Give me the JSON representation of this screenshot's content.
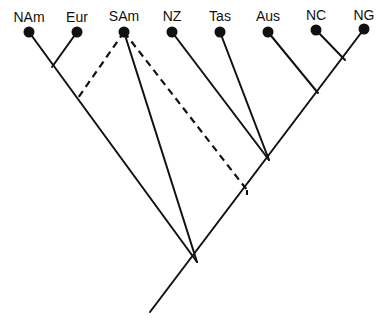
{
  "diagram": {
    "type": "cladogram",
    "colors": {
      "line": "#111111",
      "background": "#ffffff"
    },
    "taxa": [
      {
        "id": "NAm",
        "label": "NAm",
        "x": 29,
        "y": 32,
        "lx": 29,
        "ly": 10
      },
      {
        "id": "Eur",
        "label": "Eur",
        "x": 77,
        "y": 32,
        "lx": 77,
        "ly": 10
      },
      {
        "id": "SAm",
        "label": "SAm",
        "x": 124,
        "y": 32,
        "lx": 124,
        "ly": 9
      },
      {
        "id": "NZ",
        "label": "NZ",
        "x": 172,
        "y": 32,
        "lx": 172,
        "ly": 9
      },
      {
        "id": "Tas",
        "label": "Tas",
        "x": 220,
        "y": 32,
        "lx": 220,
        "ly": 9
      },
      {
        "id": "Aus",
        "label": "Aus",
        "x": 268,
        "y": 32,
        "lx": 268,
        "ly": 9
      },
      {
        "id": "NC",
        "label": "NC",
        "x": 316,
        "y": 30,
        "lx": 316,
        "ly": 8
      },
      {
        "id": "NG",
        "label": "NG",
        "x": 364,
        "y": 29,
        "lx": 364,
        "ly": 8
      }
    ],
    "solid_edges": [
      [
        29,
        32,
        197,
        262
      ],
      [
        77,
        32,
        52,
        67
      ],
      [
        124,
        32,
        197,
        262
      ],
      [
        150,
        312,
        364,
        29
      ],
      [
        172,
        32,
        269,
        160
      ],
      [
        220,
        32,
        269,
        160
      ],
      [
        268,
        32,
        318,
        93
      ],
      [
        316,
        30,
        345,
        60
      ]
    ],
    "dashed_edges": [
      [
        124,
        32,
        78,
        98
      ],
      [
        124,
        32,
        247,
        190
      ]
    ],
    "dashed_ticks": [
      [
        247,
        190,
        247,
        195
      ]
    ]
  }
}
